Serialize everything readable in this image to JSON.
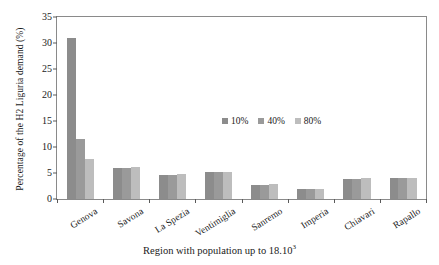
{
  "chart_data": {
    "type": "bar",
    "title": "",
    "xlabel": "Region with population up to 18.10",
    "xlabel_exponent": "3",
    "ylabel": "Percentage of the H2 Liguria demand (%)",
    "categories": [
      "Genova",
      "Savona",
      "La Spezia",
      "Ventimiglia",
      "Sanremo",
      "Imperia",
      "Chiavari",
      "Rapallo"
    ],
    "series": [
      {
        "name": "10%",
        "color": "#8c8c8c",
        "values": [
          31.0,
          6.0,
          4.7,
          5.1,
          2.7,
          2.0,
          3.9,
          4.0
        ]
      },
      {
        "name": "40%",
        "color": "#9a9a9a",
        "values": [
          11.5,
          6.0,
          4.7,
          5.1,
          2.7,
          2.0,
          3.9,
          4.0
        ]
      },
      {
        "name": "80%",
        "color": "#bdbdbd",
        "values": [
          7.7,
          6.1,
          4.8,
          5.2,
          2.8,
          2.0,
          4.0,
          4.0
        ]
      }
    ],
    "ylim": [
      0,
      35
    ],
    "yticks": [
      0,
      5,
      10,
      15,
      20,
      25,
      30,
      35
    ],
    "grid": false,
    "legend_position": "inside-upper-center",
    "axis_color": "#8a8a8a"
  }
}
